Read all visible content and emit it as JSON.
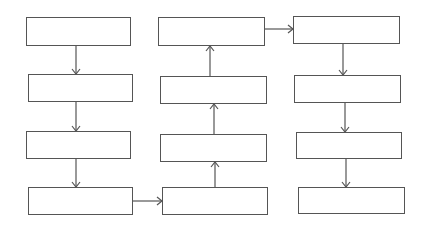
{
  "diagram": {
    "type": "flowchart",
    "stroke_color": "#555555",
    "background": "#ffffff",
    "columns": [
      {
        "id": "A",
        "flow": "down",
        "boxes": [
          {
            "id": "A1",
            "label": "",
            "x": 26,
            "y": 17,
            "w": 105,
            "h": 29
          },
          {
            "id": "A2",
            "label": "",
            "x": 28,
            "y": 74,
            "w": 105,
            "h": 28
          },
          {
            "id": "A3",
            "label": "",
            "x": 26,
            "y": 131,
            "w": 105,
            "h": 28
          },
          {
            "id": "A4",
            "label": "",
            "x": 28,
            "y": 187,
            "w": 105,
            "h": 28
          }
        ]
      },
      {
        "id": "B",
        "flow": "up",
        "boxes": [
          {
            "id": "B1",
            "label": "",
            "x": 158,
            "y": 17,
            "w": 107,
            "h": 29
          },
          {
            "id": "B2",
            "label": "",
            "x": 160,
            "y": 76,
            "w": 107,
            "h": 28
          },
          {
            "id": "B3",
            "label": "",
            "x": 160,
            "y": 134,
            "w": 107,
            "h": 28
          },
          {
            "id": "B4",
            "label": "",
            "x": 162,
            "y": 187,
            "w": 106,
            "h": 28
          }
        ]
      },
      {
        "id": "C",
        "flow": "down",
        "boxes": [
          {
            "id": "C1",
            "label": "",
            "x": 293,
            "y": 16,
            "w": 107,
            "h": 28
          },
          {
            "id": "C2",
            "label": "",
            "x": 294,
            "y": 75,
            "w": 107,
            "h": 28
          },
          {
            "id": "C3",
            "label": "",
            "x": 296,
            "y": 132,
            "w": 106,
            "h": 27
          },
          {
            "id": "C4",
            "label": "",
            "x": 298,
            "y": 187,
            "w": 107,
            "h": 27
          }
        ]
      }
    ],
    "edges": [
      {
        "from": "A1",
        "to": "A2",
        "x1": 76,
        "y1": 46,
        "x2": 76,
        "y2": 74
      },
      {
        "from": "A2",
        "to": "A3",
        "x1": 76,
        "y1": 102,
        "x2": 76,
        "y2": 131
      },
      {
        "from": "A3",
        "to": "A4",
        "x1": 76,
        "y1": 159,
        "x2": 76,
        "y2": 187
      },
      {
        "from": "A4",
        "to": "B4",
        "x1": 133,
        "y1": 201,
        "x2": 162,
        "y2": 201
      },
      {
        "from": "B4",
        "to": "B3",
        "x1": 215,
        "y1": 187,
        "x2": 215,
        "y2": 162
      },
      {
        "from": "B3",
        "to": "B2",
        "x1": 214,
        "y1": 134,
        "x2": 214,
        "y2": 104
      },
      {
        "from": "B2",
        "to": "B1",
        "x1": 210,
        "y1": 76,
        "x2": 210,
        "y2": 46
      },
      {
        "from": "B1",
        "to": "C1",
        "x1": 265,
        "y1": 29,
        "x2": 293,
        "y2": 29
      },
      {
        "from": "C1",
        "to": "C2",
        "x1": 343,
        "y1": 44,
        "x2": 343,
        "y2": 75
      },
      {
        "from": "C2",
        "to": "C3",
        "x1": 345,
        "y1": 103,
        "x2": 345,
        "y2": 132
      },
      {
        "from": "C3",
        "to": "C4",
        "x1": 346,
        "y1": 159,
        "x2": 346,
        "y2": 187
      }
    ]
  }
}
